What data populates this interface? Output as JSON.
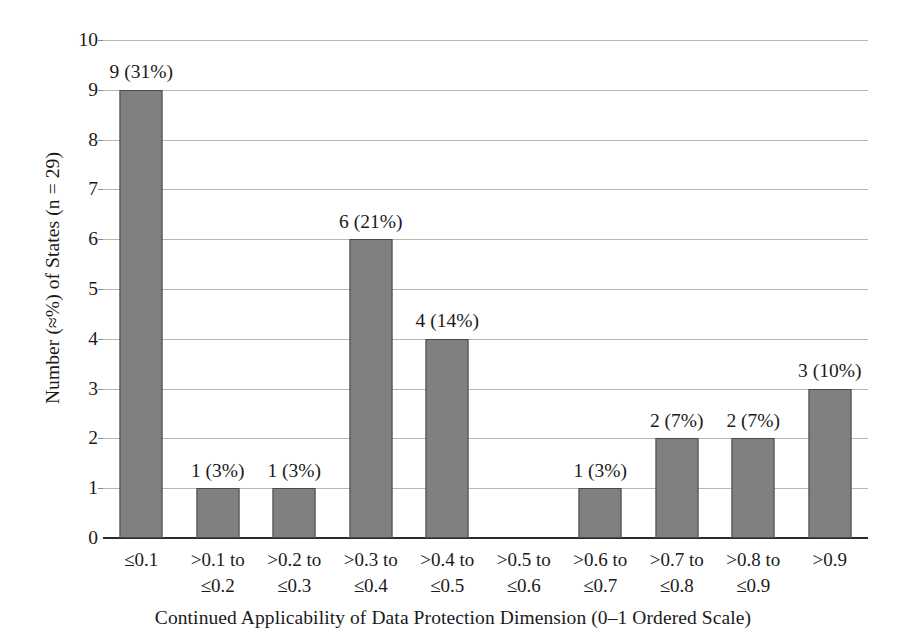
{
  "chart_data": {
    "type": "bar",
    "title": "",
    "subtitle": "",
    "xlabel": "Continued Applicability of Data Protection Dimension (0–1 Ordered Scale)",
    "ylabel": "Number (≈%) of States (n = 29)",
    "categories": [
      "≤0.1",
      ">0.1 to ≤0.2",
      ">0.2 to ≤0.3",
      ">0.3 to ≤0.4",
      ">0.4 to ≤0.5",
      ">0.5 to ≤0.6",
      ">0.6 to ≤0.7",
      ">0.7 to ≤0.8",
      ">0.8 to ≤0.9",
      ">0.9"
    ],
    "category_lines": [
      [
        "≤0.1",
        ""
      ],
      [
        ">0.1 to",
        "≤0.2"
      ],
      [
        ">0.2 to",
        "≤0.3"
      ],
      [
        ">0.3 to",
        "≤0.4"
      ],
      [
        ">0.4 to",
        "≤0.5"
      ],
      [
        ">0.5 to",
        "≤0.6"
      ],
      [
        ">0.6 to",
        "≤0.7"
      ],
      [
        ">0.7 to",
        "≤0.8"
      ],
      [
        ">0.8 to",
        "≤0.9"
      ],
      [
        ">0.9",
        ""
      ]
    ],
    "values": [
      9,
      1,
      1,
      6,
      4,
      0,
      1,
      2,
      2,
      3
    ],
    "percent_labels": [
      "31%",
      "3%",
      "3%",
      "21%",
      "14%",
      "",
      "3%",
      "7%",
      "7%",
      "10%"
    ],
    "bar_labels": [
      "9 (31%)",
      "1 (3%)",
      "1 (3%)",
      "6 (21%)",
      "4 (14%)",
      "",
      "1 (3%)",
      "2 (7%)",
      "2 (7%)",
      "3 (10%)"
    ],
    "ylim": [
      0,
      10
    ],
    "ytick_labels": [
      "0",
      "1",
      "2",
      "3",
      "4",
      "5",
      "6",
      "7",
      "8",
      "9",
      "10"
    ],
    "ytick_values": [
      0,
      1,
      2,
      3,
      4,
      5,
      6,
      7,
      8,
      9,
      10
    ],
    "grid": "horizontal",
    "legend": "none",
    "n_total": 29,
    "colors": {
      "bar_fill": "#808080",
      "bar_edge": "#4a4a4a",
      "gridline": "#b6b6b6",
      "axis": "#2b2b2b",
      "text": "#1a1a1a",
      "background": "#ffffff"
    }
  }
}
